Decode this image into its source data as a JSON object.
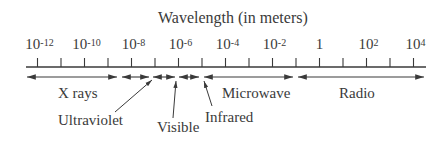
{
  "title": "Wavelength (in meters)",
  "axis": {
    "tick_labels": [
      {
        "base": "10",
        "exp": "-12",
        "tick_index": 0
      },
      {
        "base": "10",
        "exp": "-10",
        "tick_index": 2
      },
      {
        "base": "10",
        "exp": "-8",
        "tick_index": 4
      },
      {
        "base": "10",
        "exp": "-6",
        "tick_index": 6
      },
      {
        "base": "10",
        "exp": "-4",
        "tick_index": 8
      },
      {
        "base": "10",
        "exp": "-2",
        "tick_index": 10
      },
      {
        "base": "1",
        "exp": "",
        "tick_index": 12
      },
      {
        "base": "10",
        "exp": "2",
        "tick_index": 14
      },
      {
        "base": "10",
        "exp": "4",
        "tick_index": 16
      }
    ],
    "tick_count": 17
  },
  "bands": [
    {
      "name": "X rays",
      "from_tick": 0,
      "to_tick": 4
    },
    {
      "name": "Ultraviolet",
      "from_tick": 4,
      "to_tick": 5.7
    },
    {
      "name": "Visible",
      "from_tick": 5.7,
      "to_tick": 6
    },
    {
      "name": "Infrared",
      "from_tick": 6,
      "to_tick": 7.6
    },
    {
      "name": "Microwave",
      "from_tick": 7.6,
      "to_tick": 10.5
    },
    {
      "name": "Radio",
      "from_tick": 10.5,
      "to_tick": 16
    }
  ],
  "labels": {
    "xrays": "X rays",
    "ultraviolet": "Ultraviolet",
    "visible": "Visible",
    "infrared": "Infrared",
    "microwave": "Microwave",
    "radio": "Radio"
  },
  "colors": {
    "ink": "#3a3a3a",
    "background": "#ffffff"
  }
}
